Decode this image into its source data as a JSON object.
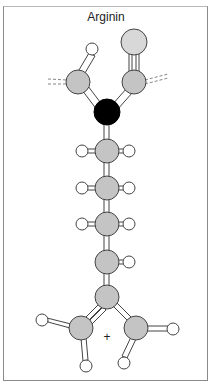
{
  "title": "Arginin",
  "charge_label": "+",
  "colors": {
    "carbon_gray": "#c4c4c4",
    "oxygen_light": "#d8d8d8",
    "hydrogen": "#ffffff",
    "alpha_carbon": "#000000",
    "outline": "#444444",
    "frame": "#8a8a8a"
  },
  "atoms": [
    {
      "id": "H-hydroxyl",
      "type": "H",
      "x": 92,
      "y": 49,
      "r": 6
    },
    {
      "id": "O-carbonyl",
      "type": "O",
      "x": 134,
      "y": 42,
      "r": 13
    },
    {
      "id": "O-left",
      "type": "C",
      "x": 78,
      "y": 82,
      "r": 12
    },
    {
      "id": "C-carboxyl",
      "type": "C",
      "x": 134,
      "y": 82,
      "r": 12
    },
    {
      "id": "C-alpha",
      "type": "black",
      "x": 107,
      "y": 112,
      "r": 13
    },
    {
      "id": "C-beta",
      "type": "C",
      "x": 107,
      "y": 151,
      "r": 12
    },
    {
      "id": "C-gamma",
      "type": "C",
      "x": 107,
      "y": 188,
      "r": 12
    },
    {
      "id": "C-delta",
      "type": "C",
      "x": 107,
      "y": 224,
      "r": 12
    },
    {
      "id": "N-epsilon",
      "type": "C",
      "x": 107,
      "y": 262,
      "r": 12
    },
    {
      "id": "C-zeta",
      "type": "C",
      "x": 107,
      "y": 297,
      "r": 12
    },
    {
      "id": "N-eta1",
      "type": "C",
      "x": 81,
      "y": 328,
      "r": 12
    },
    {
      "id": "N-eta2",
      "type": "C",
      "x": 136,
      "y": 328,
      "r": 12
    }
  ],
  "hydrogens": [
    {
      "x": 82,
      "y": 151
    },
    {
      "x": 129,
      "y": 151
    },
    {
      "x": 82,
      "y": 188
    },
    {
      "x": 129,
      "y": 188
    },
    {
      "x": 82,
      "y": 224
    },
    {
      "x": 129,
      "y": 224
    },
    {
      "x": 129,
      "y": 262
    },
    {
      "x": 42,
      "y": 320
    },
    {
      "x": 86,
      "y": 366
    },
    {
      "x": 124,
      "y": 363
    },
    {
      "x": 173,
      "y": 329
    }
  ]
}
